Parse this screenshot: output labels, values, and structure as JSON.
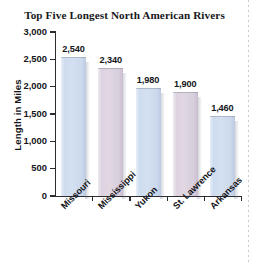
{
  "chart_data": {
    "type": "bar",
    "title": "Top Five Longest North American Rivers",
    "xlabel": "",
    "ylabel": "Length in Miles",
    "categories": [
      "Missouri",
      "Mississippi",
      "Yukon",
      "St. Lawrence",
      "Arkansas"
    ],
    "values": [
      2540,
      2340,
      1980,
      1900,
      1460
    ],
    "value_labels": [
      "2,540",
      "2,340",
      "1,980",
      "1,900",
      "1,460"
    ],
    "ylim": [
      0,
      3000
    ],
    "ytick_values": [
      0,
      500,
      1000,
      1500,
      2000,
      2500,
      3000
    ],
    "ytick_labels": [
      "0",
      "500",
      "1,000",
      "1,500",
      "2,000",
      "2,500",
      "3,000"
    ],
    "grid": false,
    "legend": false,
    "bar_colors": [
      "#d3e0f1",
      "#e0d7e2",
      "#d3e0f1",
      "#e0d7e2",
      "#d3e0f1"
    ],
    "colors": {
      "blue_bar": "#d3e0f1",
      "mauve_bar": "#e0d7e2",
      "axis": "#2c2c31",
      "text": "#14141a",
      "background": "#ffffff"
    }
  }
}
